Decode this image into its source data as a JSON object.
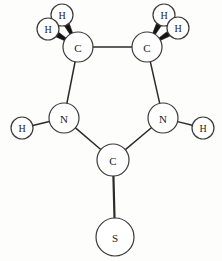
{
  "figure": {
    "background_color": "#fdfdfb",
    "bond_color": "#2b2b2b",
    "atom_outline_color": "#3a3a3a",
    "atom_fill_color": "#ffffff",
    "label_color": "#1a1a1a",
    "wedge_color": "#141414",
    "width": 222,
    "height": 261
  },
  "atoms": [
    {
      "id": "C1",
      "label": "C",
      "element": "carbon",
      "cx": 78,
      "cy": 47,
      "r": 15,
      "font_size": 11
    },
    {
      "id": "C2",
      "label": "C",
      "element": "carbon",
      "cx": 147,
      "cy": 47,
      "r": 15,
      "font_size": 11
    },
    {
      "id": "N1",
      "label": "N",
      "element": "nitrogen",
      "cx": 64,
      "cy": 118,
      "r": 15,
      "font_size": 11
    },
    {
      "id": "N2",
      "label": "N",
      "element": "nitrogen",
      "cx": 163,
      "cy": 118,
      "r": 15,
      "font_size": 11
    },
    {
      "id": "C3",
      "label": "C",
      "element": "carbon",
      "cx": 113,
      "cy": 160,
      "r": 16,
      "font_size": 11
    },
    {
      "id": "S1",
      "label": "S",
      "element": "sulfur",
      "cx": 115,
      "cy": 237,
      "r": 19,
      "font_size": 11
    },
    {
      "id": "H1",
      "label": "H",
      "element": "hydrogen",
      "cx": 62,
      "cy": 15,
      "r": 11,
      "font_size": 10
    },
    {
      "id": "H2",
      "label": "H",
      "element": "hydrogen",
      "cx": 48,
      "cy": 29,
      "r": 11,
      "font_size": 10
    },
    {
      "id": "H3",
      "label": "H",
      "element": "hydrogen",
      "cx": 164,
      "cy": 15,
      "r": 11,
      "font_size": 10
    },
    {
      "id": "H4",
      "label": "H",
      "element": "hydrogen",
      "cx": 178,
      "cy": 28,
      "r": 11,
      "font_size": 10
    },
    {
      "id": "H5",
      "label": "H",
      "element": "hydrogen",
      "cx": 22,
      "cy": 128,
      "r": 11,
      "font_size": 10
    },
    {
      "id": "H6",
      "label": "H",
      "element": "hydrogen",
      "cx": 203,
      "cy": 128,
      "r": 11,
      "font_size": 10
    }
  ],
  "bonds": [
    {
      "id": "b-c1-c2",
      "from": "C1",
      "to": "C2",
      "style": "line",
      "width": 1.5
    },
    {
      "id": "b-c1-n1",
      "from": "C1",
      "to": "N1",
      "style": "line",
      "width": 1.5
    },
    {
      "id": "b-c2-n2",
      "from": "C2",
      "to": "N2",
      "style": "line",
      "width": 1.5
    },
    {
      "id": "b-n1-c3",
      "from": "N1",
      "to": "C3",
      "style": "line",
      "width": 1.5
    },
    {
      "id": "b-n2-c3",
      "from": "N2",
      "to": "C3",
      "style": "line",
      "width": 1.5
    },
    {
      "id": "b-c3-s1",
      "from": "C3",
      "to": "S1",
      "style": "line",
      "width": 2.2
    },
    {
      "id": "b-n1-h5",
      "from": "N1",
      "to": "H5",
      "style": "line",
      "width": 1.5
    },
    {
      "id": "b-n2-h6",
      "from": "N2",
      "to": "H6",
      "style": "line",
      "width": 1.5
    },
    {
      "id": "b-c1-h1",
      "from": "C1",
      "to": "H1",
      "style": "wedge",
      "width": 5.5
    },
    {
      "id": "b-c1-h2",
      "from": "C1",
      "to": "H2",
      "style": "wedge",
      "width": 5.5
    },
    {
      "id": "b-c2-h3",
      "from": "C2",
      "to": "H3",
      "style": "wedge",
      "width": 5.5
    },
    {
      "id": "b-c2-h4",
      "from": "C2",
      "to": "H4",
      "style": "wedge",
      "width": 5.5
    }
  ],
  "chart_data": {
    "type": "diagram",
    "node_labels": [
      "C",
      "C",
      "N",
      "N",
      "C",
      "S",
      "H",
      "H",
      "H",
      "H",
      "H",
      "H"
    ],
    "element_counts": {
      "C": 3,
      "N": 2,
      "S": 1,
      "H": 6
    },
    "edges": [
      [
        "C",
        "C"
      ],
      [
        "C",
        "N"
      ],
      [
        "C",
        "N"
      ],
      [
        "N",
        "C"
      ],
      [
        "N",
        "C"
      ],
      [
        "C",
        "S"
      ],
      [
        "N",
        "H"
      ],
      [
        "N",
        "H"
      ],
      [
        "C",
        "H"
      ],
      [
        "C",
        "H"
      ],
      [
        "C",
        "H"
      ],
      [
        "C",
        "H"
      ]
    ]
  }
}
